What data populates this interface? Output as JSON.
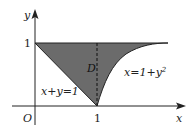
{
  "diagram": {
    "axes": {
      "x_label": "x",
      "y_label": "y",
      "origin_label": "O",
      "x_tick_label": "1",
      "y_tick_label": "1"
    },
    "region_label": "D",
    "curves": {
      "line_label": "x+y=1",
      "parabola_label": "x=1+y",
      "parabola_exponent": "2"
    },
    "colors": {
      "region_fill": "#6b6b6b",
      "stroke": "#222222",
      "background": "#ffffff"
    }
  }
}
